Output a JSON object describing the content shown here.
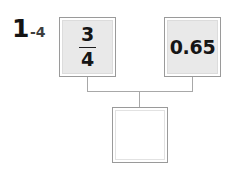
{
  "exercise": {
    "number": "1",
    "sub": "-4"
  },
  "colors": {
    "box_border": "#9a9a9a",
    "box_inner_border": "#d6d6d6",
    "box_fill": "#e9e9e9",
    "empty_fill": "#ffffff",
    "connector": "#a8a8a8",
    "text": "#161616",
    "background": "#ffffff"
  },
  "nodes": {
    "left": {
      "type": "fraction",
      "numerator": "3",
      "denominator": "4",
      "label": "3/4"
    },
    "right": {
      "type": "decimal",
      "value": "0.65"
    },
    "answer": {
      "type": "blank",
      "value": ""
    }
  },
  "connector": {
    "left_stub_x": 87,
    "right_stub_x": 192,
    "bar_y": 91,
    "drop_x": 139,
    "top_y": 77,
    "bottom_y": 107
  }
}
